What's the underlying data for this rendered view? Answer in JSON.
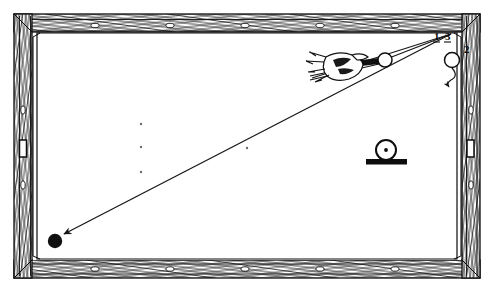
{
  "figure": {
    "kind": "technical-line-drawing",
    "view": "overhead",
    "background_color": "#ffffff",
    "ink_color": "#1a1a1a",
    "caption": ""
  },
  "table": {
    "name": "pool-table",
    "outer_rect": {
      "x": 14,
      "y": 14,
      "width": 466,
      "height": 264
    },
    "rail_thickness": 17,
    "cloth_rect": {
      "x": 37,
      "y": 33,
      "width": 420,
      "height": 226
    },
    "rail_hatch_color": "#2b2b2b",
    "rail_fill_color": "#fdfdfd",
    "sight_diamonds": {
      "shape": "small-ellipse",
      "top": [
        95,
        170,
        245,
        320,
        395
      ],
      "bottom": [
        95,
        170,
        245,
        320,
        395
      ],
      "left": [
        110,
        185
      ],
      "right": [
        110,
        185
      ]
    },
    "pockets": {
      "side_left": {
        "x": 19,
        "y": 140,
        "width": 7,
        "height": 16
      },
      "side_right": {
        "x": 468,
        "y": 140,
        "width": 7,
        "height": 16
      }
    },
    "cloth_spots": [
      {
        "x": 141,
        "y": 124
      },
      {
        "x": 141,
        "y": 147
      },
      {
        "x": 141,
        "y": 172
      },
      {
        "x": 247,
        "y": 148
      }
    ]
  },
  "labels": [
    {
      "id": "label-1",
      "text": "1",
      "x": 437,
      "y": 36
    },
    {
      "id": "label-3",
      "text": "3",
      "x": 447,
      "y": 36
    },
    {
      "id": "label-2",
      "text": "2",
      "x": 466,
      "y": 48
    }
  ],
  "shot": {
    "cue_ball": {
      "name": "cue-ball",
      "x": 383,
      "y": 60,
      "r": 7,
      "fill": "#ffffff"
    },
    "object_ball": {
      "name": "object-ball",
      "x": 55,
      "y": 240,
      "r": 7,
      "fill": "#121212"
    },
    "target_ball": {
      "name": "target-ball-at-rail",
      "x": 452,
      "y": 60,
      "r": 7,
      "fill": "#ffffff"
    },
    "aim_line": {
      "from": {
        "x": 383,
        "y": 60
      },
      "to": {
        "x": 452,
        "y": 33
      }
    },
    "travel_line": {
      "from": {
        "x": 452,
        "y": 33
      },
      "to": {
        "x": 62,
        "y": 235
      }
    },
    "arrow_head_at": {
      "x": 62,
      "y": 235
    },
    "rebound_path": {
      "points": [
        {
          "x": 452,
          "y": 68
        },
        {
          "x": 455,
          "y": 78
        },
        {
          "x": 449,
          "y": 83
        }
      ],
      "arrow_at": {
        "x": 449,
        "y": 83
      }
    }
  },
  "cue": {
    "name": "cue-stick-with-bridge-hand",
    "stick": {
      "from": {
        "x": 312,
        "y": 74
      },
      "to": {
        "x": 378,
        "y": 60
      }
    },
    "hand_center": {
      "x": 341,
      "y": 64
    },
    "hand_width": 46,
    "hand_height": 22
  },
  "inset": {
    "name": "ball-on-cushion-detail",
    "circle": {
      "x": 386,
      "y": 150,
      "r": 10
    },
    "center_dot_r": 1.8,
    "bar": {
      "x": 366,
      "y": 160,
      "width": 41,
      "height": 5
    }
  }
}
